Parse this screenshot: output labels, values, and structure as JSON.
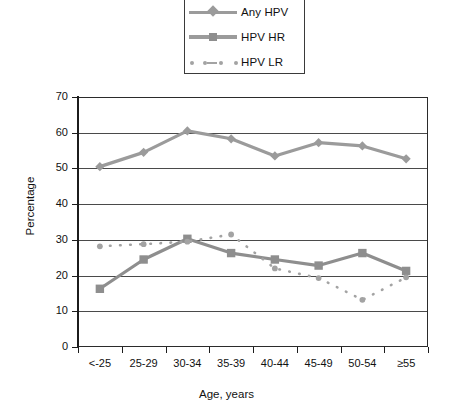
{
  "chart_data": {
    "type": "line",
    "title": "",
    "xlabel": "Age, years",
    "ylabel": "Percentage",
    "categories": [
      "<-25",
      "25-29",
      "30-34",
      "35-39",
      "40-44",
      "45-49",
      "50-54",
      "≥55"
    ],
    "ylim": [
      0,
      70
    ],
    "ytick_step": 10,
    "yticks": [
      0,
      10,
      20,
      30,
      40,
      50,
      60,
      70
    ],
    "ytick_labels": [
      "0",
      "10",
      "20",
      "30",
      "40",
      "50",
      "60",
      "70"
    ],
    "grid": "horizontal",
    "legend_position": "top-center",
    "series": [
      {
        "name": "Any HPV",
        "marker": "diamond",
        "linestyle": "solid",
        "color": "#9b9b9b",
        "values": [
          50.5,
          54.5,
          60.5,
          58.3,
          53.5,
          57.2,
          56.3,
          52.7
        ]
      },
      {
        "name": "HPV HR",
        "marker": "square",
        "linestyle": "solid",
        "color": "#8e8e8e",
        "values": [
          16.3,
          24.5,
          30.3,
          26.3,
          24.5,
          22.8,
          26.3,
          21.3
        ]
      },
      {
        "name": "HPV LR",
        "marker": "circle",
        "linestyle": "dotted",
        "color": "#a3a3a3",
        "values": [
          28.2,
          28.8,
          29.5,
          31.5,
          22.0,
          19.3,
          13.2,
          19.5
        ]
      }
    ]
  },
  "legend": {
    "items": [
      {
        "label": "Any HPV",
        "icon": "diamond-line-swatch"
      },
      {
        "label": "HPV HR",
        "icon": "square-line-swatch"
      },
      {
        "label": "HPV LR",
        "icon": "dotted-circle-swatch"
      }
    ]
  },
  "axes": {
    "y_title": "Percentage",
    "x_title": "Age, years"
  }
}
